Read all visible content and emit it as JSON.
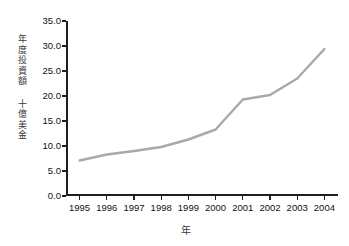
{
  "chart_data": {
    "type": "line",
    "title": "",
    "xlabel": "年",
    "ylabel_lines": [
      "年度投資額",
      "十億美金"
    ],
    "ylabel": "年度投資額 十億美金",
    "categories": [
      "1995",
      "1996",
      "1997",
      "1998",
      "1999",
      "2000",
      "2001",
      "2002",
      "2003",
      "2004"
    ],
    "x": [
      1995,
      1996,
      1997,
      1998,
      1999,
      2000,
      2001,
      2002,
      2003,
      2004
    ],
    "values": [
      7.1,
      8.3,
      9.0,
      9.8,
      11.3,
      13.3,
      19.3,
      20.2,
      23.5,
      29.4
    ],
    "series": [
      {
        "name": "年度投資額",
        "values": [
          7.1,
          8.3,
          9.0,
          9.8,
          11.3,
          13.3,
          19.3,
          20.2,
          23.5,
          29.4
        ]
      }
    ],
    "ylim": [
      0.0,
      35.0
    ],
    "yticks": [
      0.0,
      5.0,
      10.0,
      15.0,
      20.0,
      25.0,
      30.0,
      35.0
    ],
    "ytick_labels": [
      "0.0",
      "5.0",
      "10.0",
      "15.0",
      "20.0",
      "25.0",
      "30.0",
      "35.0"
    ],
    "xtick_labels": [
      "1995",
      "1996",
      "1997",
      "1998",
      "1999",
      "2000",
      "2001",
      "2002",
      "2003",
      "2004"
    ],
    "grid": false,
    "legend": false,
    "line_color": "#a9a9a9",
    "axis_color": "#1f1f1f",
    "background": "#ffffff"
  },
  "y_axis": {
    "title_segments": [
      {
        "chars": [
          "年",
          "度",
          "投",
          "資",
          "額"
        ]
      },
      {
        "chars": [
          "十",
          "億",
          "美",
          "金"
        ]
      }
    ]
  },
  "x_axis": {
    "title": "年"
  }
}
